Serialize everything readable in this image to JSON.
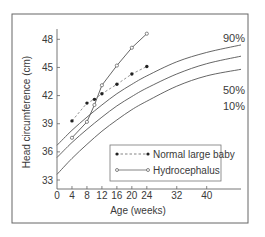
{
  "chart_data": {
    "type": "line",
    "title": "",
    "xlabel": "Age (weeks)",
    "ylabel": "Head circumference (cm)",
    "xlim": [
      0,
      50
    ],
    "ylim": [
      32,
      49.5
    ],
    "x_ticks": [
      0,
      4,
      8,
      12,
      16,
      20,
      24,
      32,
      40
    ],
    "y_ticks": [
      33,
      36,
      39,
      42,
      45,
      48
    ],
    "grid": false,
    "legend_position": "lower right",
    "series": [
      {
        "name": "Normal large baby",
        "style": "dashed-filled-dots",
        "x": [
          4,
          8,
          10,
          12,
          16,
          20,
          24
        ],
        "values": [
          39.3,
          41.2,
          41.6,
          42.2,
          43.2,
          44.3,
          45.1
        ]
      },
      {
        "name": "Hydrocephalus",
        "style": "solid-open-dots",
        "x": [
          4,
          8,
          10,
          12,
          16,
          20,
          24
        ],
        "values": [
          37.5,
          39.2,
          41.0,
          43.1,
          45.2,
          47.1,
          48.6
        ]
      }
    ],
    "percentile_curves": [
      {
        "label": "90%",
        "x": [
          0,
          4,
          8,
          12,
          16,
          20,
          24,
          32,
          40,
          50
        ],
        "values": [
          36.7,
          38.3,
          39.7,
          41.0,
          42.2,
          43.2,
          44.1,
          45.6,
          46.6,
          47.4
        ]
      },
      {
        "label": "50%",
        "x": [
          0,
          4,
          8,
          12,
          16,
          20,
          24,
          32,
          40,
          50
        ],
        "values": [
          35.4,
          37.0,
          38.4,
          39.7,
          40.9,
          41.9,
          42.8,
          44.3,
          45.4,
          46.2
        ]
      },
      {
        "label": "10%",
        "x": [
          0,
          4,
          8,
          12,
          16,
          20,
          24,
          32,
          40,
          50
        ],
        "values": [
          33.6,
          35.3,
          36.8,
          38.2,
          39.4,
          40.5,
          41.4,
          43.0,
          44.1,
          44.8
        ]
      }
    ],
    "colors": {
      "line": "#555555",
      "text": "#3a3a3a",
      "frame": "#666666"
    }
  }
}
